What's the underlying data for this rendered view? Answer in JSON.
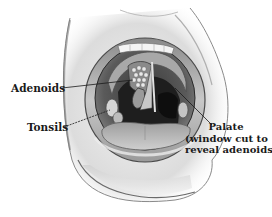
{
  "figure": {
    "style": "grayscale pencil illustration"
  },
  "labels": {
    "adenoids": "Adenoids",
    "tonsils": "Tonsils",
    "palate": {
      "line1": "Palate",
      "line2": "(window cut to",
      "line3": "reveal adenoids)"
    }
  },
  "colors": {
    "background": "#ffffff",
    "text": "#1a1a1a",
    "skin_light": "#e8e8e8",
    "skin_shadow": "#9a9a9a",
    "mouth_dark": "#2a2a2a",
    "tongue": "#b5b5b5",
    "teeth": "#f4f4f4"
  }
}
